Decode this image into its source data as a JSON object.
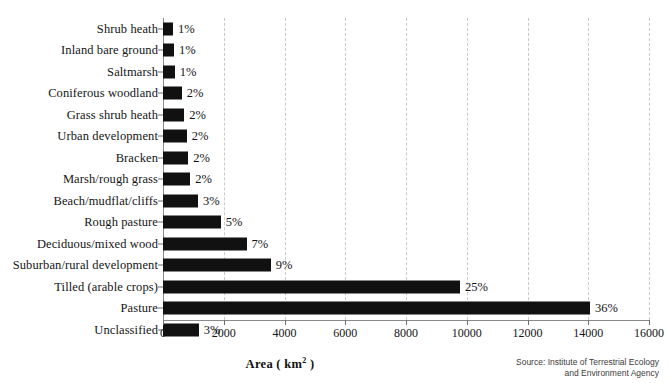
{
  "chart_data": {
    "type": "bar",
    "orientation": "horizontal",
    "title": "",
    "subtitle": "",
    "xlabel": "Area ( km2 )",
    "xlabel_base": "Area ( km",
    "xlabel_sup": "2",
    "xlabel_close": " )",
    "ylabel": "",
    "xlim": [
      0,
      16000
    ],
    "grid": true,
    "grid_axis": "x",
    "grid_style": "dashed",
    "legend": "none",
    "bar_color": "#111111",
    "axis_color": "#8a8a8a",
    "grid_color": "#c9c9c9",
    "xticks": [
      0,
      2000,
      4000,
      6000,
      8000,
      10000,
      12000,
      14000,
      16000
    ],
    "xtick_labels": [
      "0",
      "2000",
      "4000",
      "6000",
      "8000",
      "10000",
      "12000",
      "14000",
      "16000"
    ],
    "categories": [
      "Shrub heath",
      "Inland bare ground",
      "Saltmarsh",
      "Coniferous woodland",
      "Grass shrub heath",
      "Urban development",
      "Bracken",
      "Marsh/rough grass",
      "Beach/mudflat/cliffs",
      "Rough pasture",
      "Deciduous/mixed wood",
      "Suburban/rural development",
      "Tilled (arable crops)",
      "Pasture",
      "Unclassified"
    ],
    "values": [
      330,
      360,
      390,
      620,
      700,
      780,
      830,
      900,
      1150,
      1900,
      2750,
      3550,
      9780,
      14060,
      1180
    ],
    "data_labels": [
      "1%",
      "1%",
      "1%",
      "2%",
      "2%",
      "2%",
      "2%",
      "2%",
      "3%",
      "5%",
      "7%",
      "9%",
      "25%",
      "36%",
      "3%"
    ],
    "source": {
      "line1": "Source: Institute of Terrestrial Ecology",
      "line2": "and Environment Agency"
    }
  }
}
